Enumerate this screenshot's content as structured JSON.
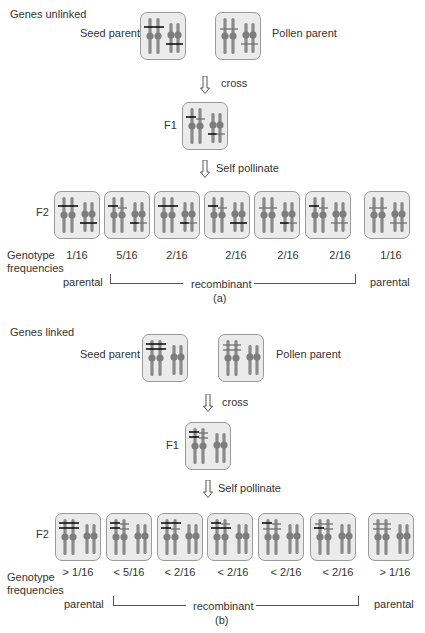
{
  "panel_a": {
    "title": "Genes unlinked",
    "seed_parent_label": "Seed parent",
    "pollen_parent_label": "Pollen parent",
    "cross_label": "cross",
    "f1_label": "F1",
    "self_pollinate_label": "Self pollinate",
    "f2_label": "F2",
    "genotype_label_line1": "Genotype",
    "genotype_label_line2": "frequencies",
    "frequencies": [
      "1/16",
      "5/16",
      "2/16",
      "2/16",
      "2/16",
      "2/16",
      "1/16"
    ],
    "parental_left": "parental",
    "recombinant": "recombinant",
    "parental_right": "parental",
    "caption": "(a)"
  },
  "panel_b": {
    "title": "Genes linked",
    "seed_parent_label": "Seed parent",
    "pollen_parent_label": "Pollen parent",
    "cross_label": "cross",
    "f1_label": "F1",
    "self_pollinate_label": "Self pollinate",
    "f2_label": "F2",
    "genotype_label_line1": "Genotype",
    "genotype_label_line2": "frequencies",
    "frequencies": [
      "> 1/16",
      "< 5/16",
      "< 2/16",
      "< 2/16",
      "< 2/16",
      "< 2/16",
      "> 1/16"
    ],
    "parental_left": "parental",
    "recombinant": "recombinant",
    "parental_right": "parental",
    "caption": "(b)"
  },
  "colors": {
    "box_fill": "#ebebeb",
    "box_border": "#9a9a9a",
    "chromosome": "#8a8a8a",
    "centromere": "#7d7d7d",
    "allele_dominant": "#111111",
    "allele_recessive": "#555555",
    "text": "#333333"
  }
}
